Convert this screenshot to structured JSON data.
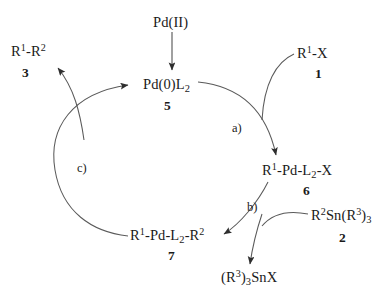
{
  "diagram": {
    "background_color": "#ffffff",
    "line_color": "#3a3a3a",
    "text_color": "#1a1a1a"
  },
  "species": {
    "precatalyst": {
      "formula": "Pd(II)",
      "number": ""
    },
    "active_catalyst": {
      "formula_html": "Pd(0)L2",
      "pre": "Pd(0)L",
      "sub": "2",
      "number": "5"
    },
    "organohalide": {
      "pre": "R",
      "sup": "1",
      "post": "-X",
      "number": "1"
    },
    "oxidative_adduct": {
      "pre": "R",
      "sup": "1",
      "mid": "-Pd-L",
      "sub": "2",
      "post": "-X",
      "number": "6"
    },
    "organostannane": {
      "pre": "R",
      "sup": "2",
      "mid": "Sn(R",
      "sup2": "3",
      "post": ")",
      "sub": "3",
      "number": "2"
    },
    "transmetalation_adduct": {
      "pre": "R",
      "sup": "1",
      "mid": "-Pd-L",
      "sub": "2",
      "post": "-R",
      "sup2": "2",
      "number": "7"
    },
    "tin_halide": {
      "pre": "(R",
      "sup": "3",
      "mid": ")",
      "sub": "3",
      "post": "SnX",
      "number": ""
    },
    "coupled_product": {
      "pre": "R",
      "sup": "1",
      "mid": "-R",
      "sup2": "2",
      "number": "3"
    }
  },
  "steps": {
    "a": {
      "label": "a)",
      "name": "oxidative-addition"
    },
    "b": {
      "label": "b)",
      "name": "transmetalation"
    },
    "c": {
      "label": "c)",
      "name": "reductive-elimination"
    }
  }
}
